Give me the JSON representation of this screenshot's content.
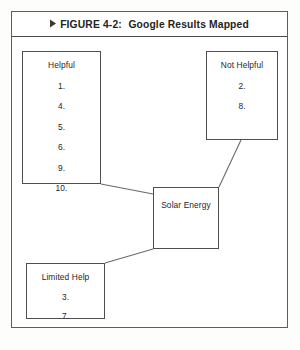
{
  "figure": {
    "arrow_icon": "right-triangle-icon",
    "label": "FIGURE 4-2:",
    "title": "Google Results Mapped"
  },
  "diagram": {
    "center": {
      "title": "Solar Energy"
    },
    "nodes": [
      {
        "id": "helpful",
        "title": "Helpful",
        "items": [
          "1.",
          "4.",
          "5.",
          "6.",
          "9.",
          "10."
        ]
      },
      {
        "id": "not-helpful",
        "title": "Not Helpful",
        "items": [
          "2.",
          "8."
        ]
      },
      {
        "id": "limited-help",
        "title": "Limited Help",
        "items": [
          "3.",
          "7."
        ]
      }
    ],
    "connections": [
      {
        "from": "helpful",
        "to": "solar-energy"
      },
      {
        "from": "not-helpful",
        "to": "solar-energy"
      },
      {
        "from": "solar-energy",
        "to": "limited-help"
      }
    ]
  },
  "colors": {
    "page_background": "#fdfdfc",
    "frame_border": "#5d5d5d",
    "box_border": "#4f4f4f",
    "text": "#272727",
    "connector": "#6a6a6a"
  }
}
